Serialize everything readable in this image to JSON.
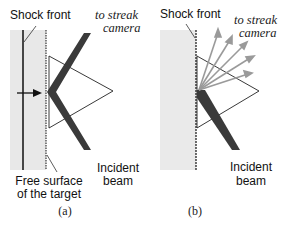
{
  "panels": [
    {
      "id": "a",
      "labels": {
        "shock_front": "Shock front",
        "camera_1": "to streak",
        "camera_2": "camera",
        "free_surface_1": "Free surface",
        "free_surface_2": "of the target",
        "incident_1": "Incident",
        "incident_2": "beam",
        "caption": "(a)"
      }
    },
    {
      "id": "b",
      "labels": {
        "shock_front": "Shock front",
        "camera_1": "to streak",
        "camera_2": "camera",
        "incident_1": "Incident",
        "incident_2": "beam",
        "caption": "(b)"
      }
    }
  ],
  "colors": {
    "target_fill": "#e8e8e8",
    "beam": "#3a3a3a",
    "line": "#111111",
    "scatter": "#9a9a9a"
  }
}
